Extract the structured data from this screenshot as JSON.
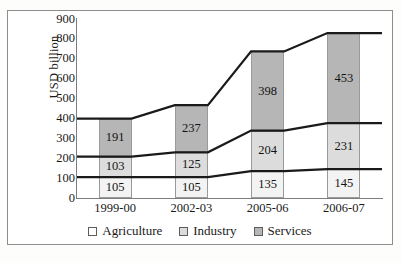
{
  "chart_data": {
    "type": "bar",
    "subtype": "stacked-bar-with-connector-lines",
    "title": "",
    "xlabel": "",
    "ylabel": "USD billion",
    "ylim": [
      0,
      900
    ],
    "ytick_step": 100,
    "yticks": [
      900,
      800,
      700,
      600,
      500,
      400,
      300,
      200,
      100,
      0
    ],
    "grid": false,
    "legend_position": "bottom-center",
    "categories": [
      "1999-00",
      "2002-03",
      "2005-06",
      "2006-07"
    ],
    "series": [
      {
        "name": "Agriculture",
        "color": "#f3f3f3",
        "values": [
          105,
          105,
          135,
          145
        ]
      },
      {
        "name": "Industry",
        "color": "#dcdcdc",
        "values": [
          103,
          125,
          204,
          231
        ]
      },
      {
        "name": "Services",
        "color": "#b6b6b6",
        "values": [
          191,
          237,
          398,
          453
        ]
      }
    ],
    "totals": [
      399,
      467,
      737,
      829
    ],
    "stack_order_bottom_to_top": [
      "Agriculture",
      "Industry",
      "Services"
    ],
    "data_labels_shown": true
  },
  "legend": {
    "items": [
      {
        "label": "Agriculture",
        "swatch": "#ffffff"
      },
      {
        "label": "Industry",
        "swatch": "#dcdcdc"
      },
      {
        "label": "Services",
        "swatch": "#b6b6b6"
      }
    ]
  },
  "colors": {
    "frame": "#8d8d8d",
    "axis": "#7d7d7d",
    "connector_line": "#1a1a1a",
    "text": "#141414"
  }
}
